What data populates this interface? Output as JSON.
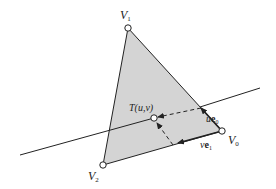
{
  "diagram": {
    "colors": {
      "triangle_fill": "#d4d4d4",
      "stroke": "#222222",
      "background": "#ffffff"
    },
    "vertices": {
      "V0": {
        "label": "V",
        "sub": "0"
      },
      "V1": {
        "label": "V",
        "sub": "1"
      },
      "V2": {
        "label": "V",
        "sub": "2"
      }
    },
    "point": {
      "label": "T(u,v)"
    },
    "vectors": {
      "ue0": {
        "coef": "u",
        "vec": "e",
        "sub": "0"
      },
      "ve1": {
        "coef": "v",
        "vec": "e",
        "sub": "1"
      }
    }
  }
}
